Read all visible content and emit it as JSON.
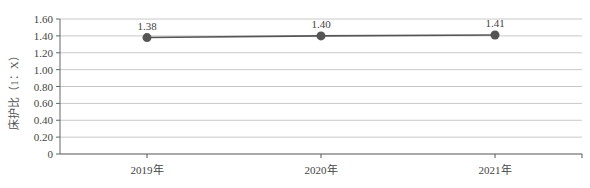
{
  "chart_data": {
    "type": "line",
    "title": "",
    "xlabel": "",
    "ylabel": "床护比（1：X）",
    "categories": [
      "2019年",
      "2020年",
      "2021年"
    ],
    "series": [
      {
        "name": "床护比",
        "values": [
          1.38,
          1.4,
          1.41
        ]
      }
    ],
    "data_labels": [
      "1.38",
      "1.40",
      "1.41"
    ],
    "ylim": [
      0,
      1.6
    ],
    "yticks": [
      0,
      0.2,
      0.4,
      0.6,
      0.8,
      1.0,
      1.2,
      1.4,
      1.6
    ],
    "ytick_labels": [
      "0",
      "0.20",
      "0.40",
      "0.60",
      "0.80",
      "1.00",
      "1.20",
      "1.40",
      "1.60"
    ],
    "grid": true,
    "legend": null,
    "line_color": "#555555",
    "marker_color": "#555555"
  }
}
